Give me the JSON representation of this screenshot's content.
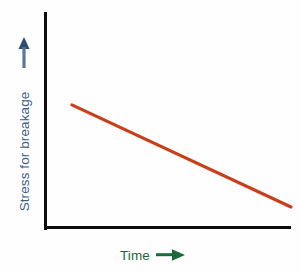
{
  "chart_data": {
    "type": "line",
    "title": "",
    "subtitle": "",
    "xlabel": "Time",
    "ylabel": "Stress for breakage",
    "grid": false,
    "legend": null,
    "legend_position": "none",
    "xlim": [
      0,
      1
    ],
    "ylim": [
      0,
      1
    ],
    "xticks": [],
    "yticks": [],
    "xticklabels": [],
    "yticklabels": [],
    "annotations": [],
    "series": [
      {
        "name": "stress-for-breakage",
        "color": "#c8401a",
        "style": "solid",
        "x": [
          0.102,
          1.0
        ],
        "y": [
          0.566,
          0.089
        ],
        "points": [
          {
            "x": 0.102,
            "y": 0.566
          },
          {
            "x": 1.0,
            "y": 0.089
          }
        ],
        "description": "Straight line decreasing from upper-left to lower-right"
      }
    ]
  },
  "axes": {
    "y_axis": {
      "label": "Stress for breakage",
      "color": "#3f5e87",
      "arrow_direction": "up",
      "arrow_icon": "arrow-up-icon",
      "line_color": "#0d0d0d"
    },
    "x_axis": {
      "label": "Time",
      "color": "#1a6b3c",
      "arrow_direction": "right",
      "arrow_icon": "arrow-right-icon",
      "line_color": "#0d0d0d"
    }
  },
  "colors": {
    "background": "#fefefe",
    "axis": "#0d0d0d",
    "data_line": "#c8401a",
    "y_label": "#3f5e87",
    "x_label": "#1a6b3c"
  }
}
